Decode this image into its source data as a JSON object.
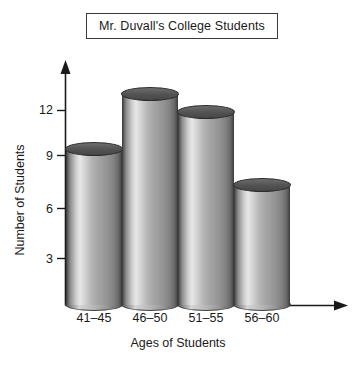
{
  "chart_data": {
    "type": "bar",
    "title": "Mr. Duvall's College Students",
    "xlabel": "Ages of Students",
    "ylabel": "Number of Students",
    "categories": [
      "41–45",
      "46–50",
      "51–55",
      "56–60"
    ],
    "values": [
      9,
      12,
      11,
      7
    ],
    "ytick_labels": [
      "3",
      "6",
      "9",
      "12"
    ],
    "ytick_values": [
      3,
      6,
      9,
      12
    ],
    "ylim": [
      0,
      13.5
    ],
    "grid": false,
    "legend": null,
    "style": {
      "bar_style": "3d-cylinder",
      "bar_fill": "#b4b4b4",
      "bar_top_fill": "#525252",
      "outline": "#3f3f3f",
      "axis_color": "#1a1a1a",
      "background": "#ffffff"
    }
  }
}
